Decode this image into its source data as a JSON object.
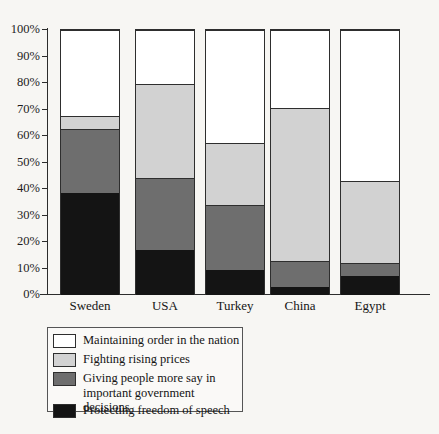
{
  "chart_data": {
    "type": "bar",
    "subtype": "stacked-100-percent",
    "title": "",
    "xlabel": "",
    "ylabel": "",
    "ylim": [
      0,
      100
    ],
    "grid": false,
    "legend_position": "bottom-left",
    "categories": [
      "Sweden",
      "USA",
      "Turkey",
      "China",
      "Egypt"
    ],
    "ytick_labels": [
      "0%",
      "10%",
      "20%",
      "30%",
      "40%",
      "50%",
      "60%",
      "70%",
      "80%",
      "90%",
      "100%"
    ],
    "ytick_values": [
      0,
      10,
      20,
      30,
      40,
      50,
      60,
      70,
      80,
      90,
      100
    ],
    "series": [
      {
        "name": "Protecting freedom of speech",
        "color": "#141414",
        "values": [
          38.5,
          17,
          9.5,
          3,
          7
        ]
      },
      {
        "name": "Giving people more say in\nimportant government decisions",
        "color": "#6e6e6e",
        "values": [
          24,
          27,
          24.5,
          10,
          5
        ]
      },
      {
        "name": "Fighting rising prices",
        "color": "#d2d2d2",
        "values": [
          5,
          35.5,
          23.5,
          57.5,
          31
        ]
      },
      {
        "name": "Maintaining order in the nation",
        "color": "#ffffff",
        "values": [
          32.5,
          20.5,
          42.5,
          29.5,
          57
        ]
      }
    ],
    "legend_entries": [
      {
        "label": "Maintaining order in the nation",
        "color": "#ffffff"
      },
      {
        "label": "Fighting rising prices",
        "color": "#d2d2d2"
      },
      {
        "label": "Giving people more say in\nimportant government decisions",
        "color": "#6e6e6e"
      },
      {
        "label": "Protecting freedom of speech",
        "color": "#141414"
      }
    ],
    "cumulative_tops": {
      "Sweden": {
        "black": 38.5,
        "dark_gray": 62.5,
        "light_gray": 67.5,
        "white": 100
      },
      "USA": {
        "black": 17,
        "dark_gray": 44,
        "light_gray": 79.5,
        "white": 100
      },
      "Turkey": {
        "black": 9.5,
        "dark_gray": 34,
        "light_gray": 57.5,
        "white": 100
      },
      "China": {
        "black": 3,
        "dark_gray": 13,
        "light_gray": 70.5,
        "white": 100
      },
      "Egypt": {
        "black": 7,
        "dark_gray": 12,
        "light_gray": 43,
        "white": 100
      }
    }
  }
}
